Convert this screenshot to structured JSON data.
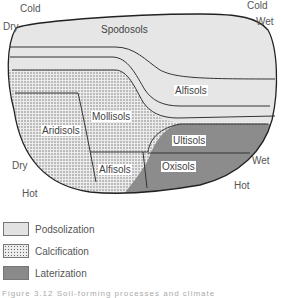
{
  "diagram": {
    "corner_labels": {
      "top_left_temp": "Cold",
      "top_left_moisture": "Dry",
      "top_right_temp": "Cold",
      "top_right_moisture": "Wet",
      "bottom_left_moisture": "Dry",
      "bottom_left_temp": "Hot",
      "bottom_right_moisture": "Wet",
      "bottom_right_temp": "Hot"
    },
    "regions": [
      {
        "name": "Spodosols",
        "process": "Podsolization"
      },
      {
        "name": "Alfisols",
        "process": "Podsolization"
      },
      {
        "name": "Mollisols",
        "process": "Calcification"
      },
      {
        "name": "Aridisols",
        "process": "Calcification"
      },
      {
        "name": "Alfisols",
        "process": "Calcification"
      },
      {
        "name": "Ultisols",
        "process": "Laterization"
      },
      {
        "name": "Oxisols",
        "process": "Laterization"
      }
    ]
  },
  "legend": [
    {
      "label": "Podsolization",
      "pattern": "light-gray",
      "color": "#e2e2e2"
    },
    {
      "label": "Calcification",
      "pattern": "dotted",
      "color": "#d8d8d8"
    },
    {
      "label": "Laterization",
      "pattern": "dark-gray",
      "color": "#8a8a8a"
    }
  ],
  "caption": "Figure 3.12 Soil-forming processes and climate"
}
